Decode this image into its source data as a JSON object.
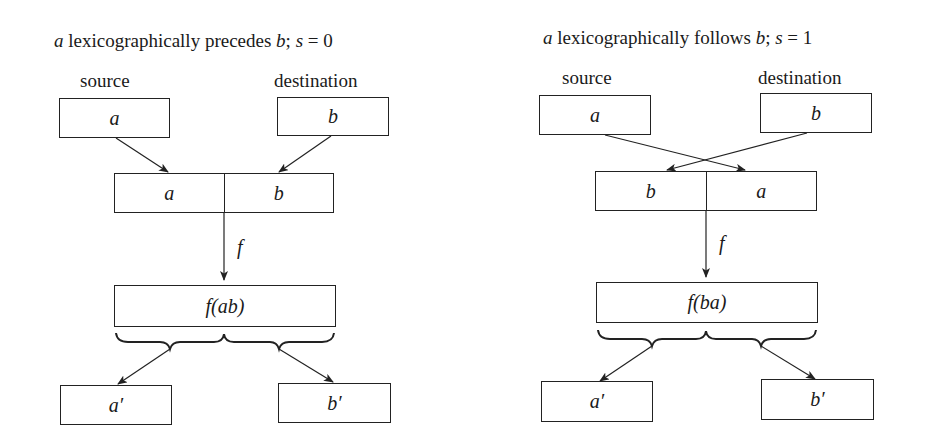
{
  "left": {
    "title": {
      "var_a": "a",
      "text": " lexicographically precedes ",
      "var_b": "b",
      "suffix": "; ",
      "s_var": "s",
      "s_eq": " = 0"
    },
    "source_label": "source",
    "destination_label": "destination",
    "source_box": "a",
    "destination_box": "b",
    "concat_left": "a",
    "concat_right": "b",
    "function_label": "f",
    "result_box": "f(ab)",
    "output_left": "a′",
    "output_right": "b′"
  },
  "right": {
    "title": {
      "var_a": "a",
      "text": " lexicographically follows ",
      "var_b": "b",
      "suffix": "; ",
      "s_var": "s",
      "s_eq": " = 1"
    },
    "source_label": "source",
    "destination_label": "destination",
    "source_box": "a",
    "destination_box": "b",
    "concat_left": "b",
    "concat_right": "a",
    "function_label": "f",
    "result_box": "f(ba)",
    "output_left": "a′",
    "output_right": "b′"
  }
}
